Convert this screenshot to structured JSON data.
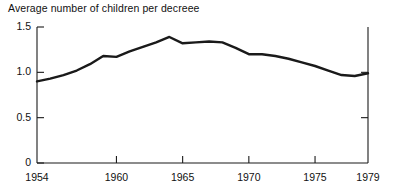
{
  "chart_data": {
    "type": "line",
    "title": "Average number of children per decreee",
    "xlabel": "",
    "ylabel": "",
    "xlim": [
      1954,
      1979
    ],
    "ylim": [
      0,
      1.5
    ],
    "grid": false,
    "legend": "none",
    "y_ticks": [
      {
        "value": 1.5,
        "label": "1.5"
      },
      {
        "value": 1.0,
        "label": "1.0"
      },
      {
        "value": 0.5,
        "label": "0.5"
      },
      {
        "value": 0,
        "label": "0"
      }
    ],
    "x_ticks": [
      {
        "value": 1954,
        "label": "1954"
      },
      {
        "value": 1960,
        "label": "1960"
      },
      {
        "value": 1965,
        "label": "1965"
      },
      {
        "value": 1970,
        "label": "1970"
      },
      {
        "value": 1975,
        "label": "1975"
      },
      {
        "value": 1979,
        "label": "1979"
      }
    ],
    "series": [
      {
        "name": "Average number of children per decree",
        "color": "#1a1a1a",
        "line_width": 2.4,
        "x": [
          1954,
          1955,
          1956,
          1957,
          1958,
          1959,
          1960,
          1961,
          1962,
          1963,
          1964,
          1965,
          1966,
          1967,
          1968,
          1969,
          1970,
          1971,
          1972,
          1973,
          1974,
          1975,
          1976,
          1977,
          1978,
          1979
        ],
        "values": [
          0.9,
          0.93,
          0.97,
          1.02,
          1.09,
          1.18,
          1.17,
          1.23,
          1.28,
          1.33,
          1.39,
          1.32,
          1.33,
          1.34,
          1.33,
          1.27,
          1.2,
          1.2,
          1.18,
          1.15,
          1.11,
          1.07,
          1.02,
          0.97,
          0.96,
          0.99
        ]
      }
    ],
    "annotations": []
  },
  "axes_geometry": {
    "plot_left_px": 37,
    "plot_right_px": 368,
    "plot_top_px": 27,
    "plot_bottom_px": 163,
    "tick_len_px": 7,
    "axis_color": "#1a1a1a",
    "axis_width": 1.1
  }
}
